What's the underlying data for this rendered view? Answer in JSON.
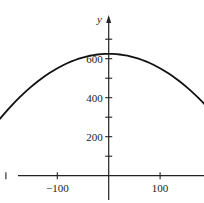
{
  "chart_data": {
    "type": "line",
    "title": "",
    "xlabel": "",
    "ylabel": "y",
    "xlim": [
      -300,
      300
    ],
    "ylim": [
      0,
      700
    ],
    "grid": false,
    "legend": null,
    "x_tick_labels": [
      "−300",
      "−100",
      "100",
      "300"
    ],
    "x_tick_values_labeled": [
      -300,
      -100,
      100,
      300
    ],
    "x_tick_values": [
      -300,
      -200,
      -100,
      0,
      100,
      200,
      300
    ],
    "y_tick_labels": [
      "200",
      "400",
      "600"
    ],
    "y_tick_values_labeled": [
      200,
      400,
      600
    ],
    "y_tick_values": [
      100,
      200,
      300,
      400,
      500,
      600,
      700
    ],
    "series": [
      {
        "name": "parabola",
        "description": "downward-opening parabola, vertex near (0, 625), x-intercepts near ±290",
        "x": [
          -290,
          -250,
          -200,
          -150,
          -100,
          -50,
          0,
          50,
          100,
          150,
          200,
          250,
          290
        ],
        "y": [
          0,
          161,
          328,
          458,
          551,
          607,
          625,
          607,
          551,
          458,
          328,
          161,
          0
        ]
      }
    ]
  },
  "axes": {
    "y_axis_label": "y"
  }
}
